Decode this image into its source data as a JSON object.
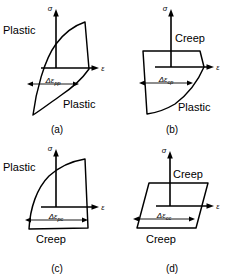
{
  "figure": {
    "background_color": "#ffffff",
    "line_color": "#000000"
  },
  "axes": {
    "y_label": "σ",
    "x_label": "ε"
  },
  "panels": [
    {
      "id": "a",
      "caption": "(a)",
      "loop_type": "pp",
      "shape": "lens",
      "delta_symbol": "Δε",
      "delta_subscript": "pp",
      "delta_label_full": "Δεpp",
      "region_labels": [
        {
          "text": "Plastic",
          "position": "upper-left"
        },
        {
          "text": "Plastic",
          "position": "lower-right"
        }
      ]
    },
    {
      "id": "b",
      "caption": "(b)",
      "loop_type": "cp",
      "shape": "flat-top-curved-bottom",
      "delta_symbol": "Δε",
      "delta_subscript": "cp",
      "delta_label_full": "Δεcp",
      "region_labels": [
        {
          "text": "Creep",
          "position": "upper-right"
        },
        {
          "text": "Plastic",
          "position": "lower-right"
        }
      ]
    },
    {
      "id": "c",
      "caption": "(c)",
      "loop_type": "pc",
      "shape": "curved-top-flat-bottom",
      "delta_symbol": "Δε",
      "delta_subscript": "pc",
      "delta_label_full": "Δεpc",
      "region_labels": [
        {
          "text": "Plastic",
          "position": "upper-left"
        },
        {
          "text": "Creep",
          "position": "lower-center"
        }
      ]
    },
    {
      "id": "d",
      "caption": "(d)",
      "loop_type": "cc",
      "shape": "parallelogram",
      "delta_symbol": "Δε",
      "delta_subscript": "cc",
      "delta_label_full": "Δεcc",
      "region_labels": [
        {
          "text": "Creep",
          "position": "upper-right"
        },
        {
          "text": "Creep",
          "position": "lower-center"
        }
      ]
    }
  ]
}
